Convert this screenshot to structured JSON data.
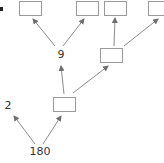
{
  "diagram": {
    "type": "factor-tree",
    "root": {
      "label": "180"
    },
    "nodes": [
      {
        "id": "n180",
        "label": "180",
        "kind": "text"
      },
      {
        "id": "n2",
        "label": "2",
        "kind": "text"
      },
      {
        "id": "nBlankA",
        "label": "",
        "kind": "blank-box"
      },
      {
        "id": "n9",
        "label": "9",
        "kind": "text"
      },
      {
        "id": "nBlankB",
        "label": "",
        "kind": "blank-box"
      },
      {
        "id": "nBlank1",
        "label": "",
        "kind": "blank-box"
      },
      {
        "id": "nBlank2",
        "label": "",
        "kind": "blank-box"
      },
      {
        "id": "nBlank3",
        "label": "",
        "kind": "blank-box"
      },
      {
        "id": "nBlank4",
        "label": "",
        "kind": "blank-box"
      }
    ],
    "edges": [
      {
        "from": "n180",
        "to": "n2"
      },
      {
        "from": "n180",
        "to": "nBlankA"
      },
      {
        "from": "nBlankA",
        "to": "n9"
      },
      {
        "from": "nBlankA",
        "to": "nBlankB"
      },
      {
        "from": "n9",
        "to": "nBlank1"
      },
      {
        "from": "n9",
        "to": "nBlank2"
      },
      {
        "from": "nBlankB",
        "to": "nBlank3"
      },
      {
        "from": "nBlankB",
        "to": "nBlank4"
      }
    ],
    "labels": {
      "root": "180",
      "left_factor": "2",
      "middle_factor": "9"
    },
    "colors": {
      "line": "#8c8c8c",
      "box_border": "#9a9a9a",
      "text": "#333333"
    }
  }
}
